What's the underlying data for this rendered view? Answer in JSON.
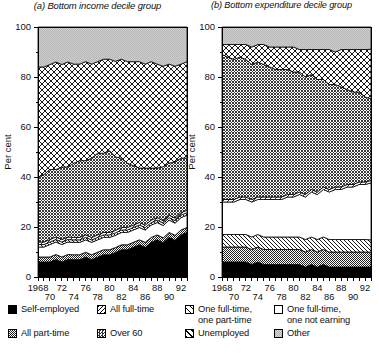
{
  "chart_data": [
    {
      "type": "area",
      "title": "(a) Bottom income decile group",
      "xlabel": "",
      "ylabel": "Per cent",
      "ylim": [
        0,
        100
      ],
      "yticks": [
        0,
        20,
        40,
        60,
        80,
        100
      ],
      "xlim": [
        1968,
        1993
      ],
      "xticks_top": [
        "1968",
        "72",
        "76",
        "80",
        "84",
        "88",
        "92"
      ],
      "xticks_bottom": [
        "70",
        "74",
        "78",
        "82",
        "86",
        "90"
      ],
      "grid": false,
      "stacked": true,
      "x": [
        1968,
        1969,
        1970,
        1971,
        1972,
        1973,
        1974,
        1975,
        1976,
        1977,
        1978,
        1979,
        1980,
        1981,
        1982,
        1983,
        1984,
        1985,
        1986,
        1987,
        1988,
        1989,
        1990,
        1991,
        1992,
        1993
      ],
      "series": [
        {
          "name": "Self-employed",
          "pattern": "solid-black",
          "values": [
            6,
            6,
            6,
            7,
            6,
            7,
            7,
            7,
            8,
            7,
            8,
            9,
            9,
            10,
            11,
            11,
            12,
            13,
            12,
            14,
            15,
            14,
            16,
            15,
            17,
            18
          ]
        },
        {
          "name": "All part-time",
          "pattern": "fine-checker",
          "values": [
            2,
            2,
            2,
            2,
            2,
            2,
            2,
            2,
            2,
            2,
            2,
            2,
            2,
            2,
            2,
            2,
            2,
            2,
            2,
            2,
            2,
            2,
            2,
            2,
            2,
            2
          ]
        },
        {
          "name": "One full-time, one not earning",
          "pattern": "white",
          "values": [
            4,
            4,
            5,
            5,
            5,
            5,
            5,
            5,
            5,
            5,
            5,
            5,
            5,
            5,
            5,
            5,
            5,
            5,
            5,
            5,
            5,
            5,
            5,
            5,
            5,
            5
          ]
        },
        {
          "name": "All full-time",
          "pattern": "diagonal-hatch",
          "values": [
            1,
            1,
            1,
            1,
            1,
            1,
            1,
            1,
            1,
            1,
            1,
            1,
            1,
            1,
            1,
            1,
            1,
            1,
            1,
            1,
            1,
            1,
            1,
            1,
            1,
            1
          ]
        },
        {
          "name": "One full-time, one part-time",
          "pattern": "diagonal-slash",
          "values": [
            1,
            1,
            1,
            1,
            1,
            1,
            1,
            1,
            1,
            1,
            1,
            1,
            1,
            1,
            1,
            1,
            1,
            1,
            1,
            1,
            1,
            1,
            1,
            1,
            1,
            1
          ]
        },
        {
          "name": "Over 60",
          "pattern": "dense-crosshatch",
          "values": [
            26,
            27,
            28,
            27,
            29,
            28,
            30,
            31,
            30,
            32,
            33,
            32,
            33,
            30,
            28,
            26,
            24,
            22,
            23,
            21,
            20,
            22,
            21,
            23,
            22,
            21
          ]
        },
        {
          "name": "Unemployed",
          "pattern": "open-crosshatch",
          "values": [
            44,
            43,
            42,
            43,
            41,
            42,
            40,
            39,
            40,
            38,
            37,
            38,
            37,
            39,
            40,
            41,
            42,
            43,
            42,
            43,
            42,
            41,
            40,
            39,
            38,
            39
          ]
        },
        {
          "name": "Other",
          "pattern": "light-stipple",
          "values": [
            16,
            16,
            15,
            14,
            15,
            14,
            15,
            15,
            14,
            15,
            14,
            13,
            13,
            14,
            13,
            14,
            14,
            14,
            15,
            14,
            15,
            16,
            15,
            16,
            15,
            14
          ]
        }
      ]
    },
    {
      "type": "area",
      "title": "(b) Bottom expenditure decile group",
      "xlabel": "",
      "ylabel": "Per cent",
      "ylim": [
        0,
        100
      ],
      "yticks": [
        0,
        20,
        40,
        60,
        80,
        100
      ],
      "xlim": [
        1968,
        1993
      ],
      "xticks_top": [
        "1968",
        "72",
        "76",
        "80",
        "84",
        "88",
        "92"
      ],
      "xticks_bottom": [
        "70",
        "74",
        "78",
        "82",
        "86",
        "90"
      ],
      "grid": false,
      "stacked": true,
      "x": [
        1968,
        1969,
        1970,
        1971,
        1972,
        1973,
        1974,
        1975,
        1976,
        1977,
        1978,
        1979,
        1980,
        1981,
        1982,
        1983,
        1984,
        1985,
        1986,
        1987,
        1988,
        1989,
        1990,
        1991,
        1992,
        1993
      ],
      "series": [
        {
          "name": "Self-employed",
          "pattern": "solid-black",
          "values": [
            6,
            6,
            6,
            6,
            6,
            5,
            6,
            5,
            5,
            5,
            5,
            5,
            5,
            5,
            4,
            5,
            4,
            5,
            4,
            4,
            4,
            4,
            4,
            4,
            4,
            4
          ]
        },
        {
          "name": "All part-time",
          "pattern": "fine-checker",
          "values": [
            6,
            6,
            6,
            6,
            6,
            6,
            6,
            6,
            6,
            6,
            6,
            6,
            6,
            6,
            6,
            6,
            6,
            6,
            6,
            6,
            6,
            6,
            6,
            6,
            6,
            6
          ]
        },
        {
          "name": "All full-time",
          "pattern": "diagonal-hatch",
          "values": [
            5,
            5,
            5,
            5,
            5,
            5,
            5,
            5,
            5,
            5,
            5,
            5,
            5,
            5,
            5,
            5,
            5,
            5,
            5,
            5,
            5,
            5,
            5,
            5,
            5,
            5
          ]
        },
        {
          "name": "One full-time, one not earning",
          "pattern": "white",
          "values": [
            13,
            13,
            13,
            14,
            14,
            14,
            14,
            15,
            15,
            15,
            15,
            16,
            16,
            17,
            17,
            18,
            18,
            19,
            19,
            20,
            20,
            21,
            21,
            22,
            22,
            23
          ]
        },
        {
          "name": "One full-time, one part-time",
          "pattern": "diagonal-slash",
          "values": [
            1,
            1,
            1,
            1,
            1,
            1,
            1,
            1,
            1,
            1,
            1,
            1,
            1,
            1,
            1,
            1,
            1,
            1,
            1,
            1,
            1,
            1,
            1,
            1,
            1,
            1
          ]
        },
        {
          "name": "Over 60",
          "pattern": "dense-crosshatch",
          "values": [
            58,
            57,
            56,
            56,
            55,
            54,
            54,
            53,
            52,
            51,
            51,
            50,
            49,
            48,
            47,
            46,
            45,
            43,
            42,
            41,
            40,
            38,
            37,
            36,
            34,
            33
          ]
        },
        {
          "name": "Unemployed",
          "pattern": "open-crosshatch",
          "values": [
            4,
            5,
            6,
            5,
            6,
            7,
            7,
            8,
            8,
            9,
            9,
            9,
            10,
            9,
            11,
            10,
            12,
            12,
            14,
            13,
            15,
            16,
            17,
            17,
            19,
            20
          ]
        },
        {
          "name": "Other",
          "pattern": "light-stipple",
          "values": [
            7,
            7,
            7,
            7,
            7,
            8,
            7,
            7,
            8,
            8,
            8,
            8,
            8,
            9,
            9,
            9,
            9,
            9,
            9,
            10,
            9,
            9,
            9,
            9,
            9,
            9
          ]
        }
      ]
    }
  ],
  "legend": {
    "items": [
      {
        "label": "Self-employed",
        "pattern": "solid-black"
      },
      {
        "label": "All full-time",
        "pattern": "diagonal-hatch"
      },
      {
        "label": "One full-time,\none part-time",
        "pattern": "diagonal-slash"
      },
      {
        "label": "One full-time,\none not earning",
        "pattern": "white"
      },
      {
        "label": "All part-time",
        "pattern": "fine-checker"
      },
      {
        "label": "Over 60",
        "pattern": "dense-crosshatch"
      },
      {
        "label": "Unemployed",
        "pattern": "open-crosshatch"
      },
      {
        "label": "Other",
        "pattern": "light-stipple"
      }
    ]
  }
}
